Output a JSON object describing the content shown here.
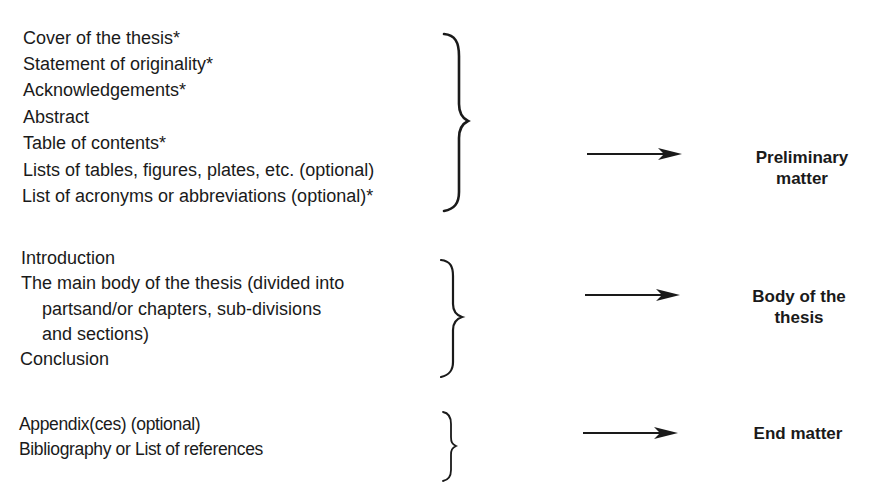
{
  "sections": [
    {
      "label_lines": [
        "Preliminary",
        "matter"
      ],
      "items": [
        {
          "text": "Cover of the thesis*",
          "indent": false
        },
        {
          "text": "Statement of originality*",
          "indent": false
        },
        {
          "text": "Acknowledgements*",
          "indent": false
        },
        {
          "text": "Abstract",
          "indent": false
        },
        {
          "text": "Table of contents*",
          "indent": false
        },
        {
          "text": "Lists of tables, figures, plates, etc. (optional)",
          "indent": false
        },
        {
          "text": "List of acronyms or abbreviations (optional)*",
          "indent": false
        }
      ]
    },
    {
      "label_lines": [
        "Body of the",
        "thesis"
      ],
      "items": [
        {
          "text": "Introduction",
          "indent": false
        },
        {
          "text": "The main body of the thesis (divided into",
          "indent": false
        },
        {
          "text": "partsand/or chapters, sub-divisions",
          "indent": true
        },
        {
          "text": "and sections)",
          "indent": true
        },
        {
          "text": "Conclusion",
          "indent": false
        }
      ]
    },
    {
      "label_lines": [
        "End matter"
      ],
      "items": [
        {
          "text": "Appendix(ces) (optional)",
          "indent": false
        },
        {
          "text": "Bibliography or List of references",
          "indent": false
        }
      ]
    }
  ],
  "colors": {
    "ink": "#1a1a1a",
    "background": "#ffffff"
  }
}
